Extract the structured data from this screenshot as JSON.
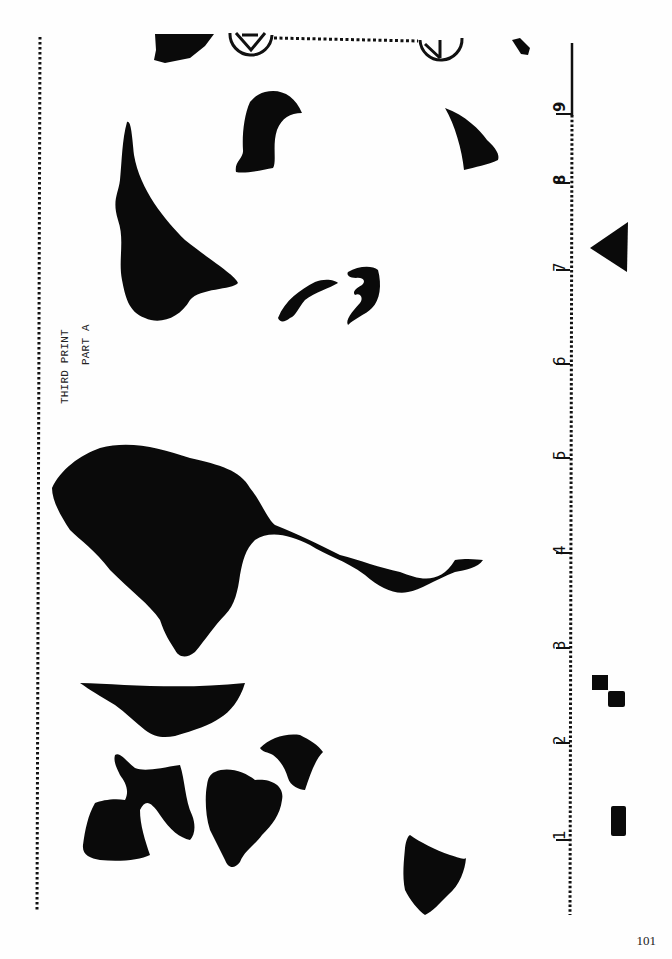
{
  "document": {
    "title_line1": "THIRD PRINT",
    "title_line2": "PART A",
    "page_number": "101"
  },
  "ruler": {
    "marks": [
      "1",
      "2",
      "3",
      "4",
      "5",
      "6",
      "7",
      "8",
      "9"
    ]
  },
  "registration_marks": {
    "left_symbol": "circle-x-registration-mark",
    "right_symbol": "circle-y-registration-mark"
  },
  "colors": {
    "ink": "#0a0a0a",
    "paper": "#fefefe"
  }
}
